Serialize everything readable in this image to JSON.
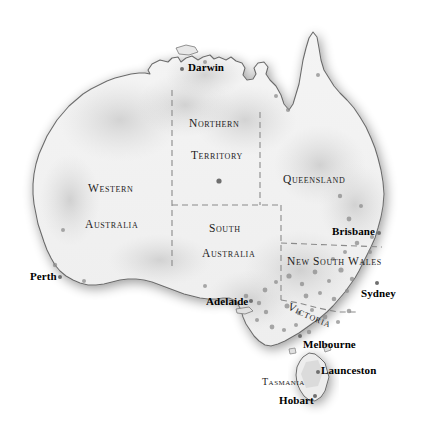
{
  "map": {
    "title": "Australia",
    "background_color": "#ffffff",
    "land_fill_color": "#f1f1f1",
    "coast_stroke_color": "#6b6b6b",
    "border_stroke_color": "#8a8a8a",
    "marker_color": "#6f6f6f",
    "label_color": "#111111"
  },
  "states": [
    {
      "id": "wa",
      "line1": "Western",
      "line2": "Australia",
      "x": 88,
      "y": 188,
      "x2": 88,
      "y2": 224
    },
    {
      "id": "nt",
      "line1": "Northern",
      "line2": "Territory",
      "x": 190,
      "y": 123,
      "x2": 192,
      "y2": 155
    },
    {
      "id": "sa",
      "line1": "South",
      "line2": "Australia",
      "x": 210,
      "y": 228,
      "x2": 203,
      "y2": 253
    },
    {
      "id": "qld",
      "line1": "Queensland",
      "x": 283,
      "y": 179
    },
    {
      "id": "nsw",
      "line1": "New South Wales",
      "x": 288,
      "y": 261
    },
    {
      "id": "vic",
      "line1": "Victoria",
      "x": 292,
      "y": 318
    },
    {
      "id": "tas",
      "line1": "Tasmania",
      "x": 268,
      "y": 382
    }
  ],
  "cities": [
    {
      "id": "darwin",
      "label": "Darwin",
      "label_x": 189,
      "label_y": 68,
      "dot_x": 182,
      "dot_y": 69
    },
    {
      "id": "brisbane",
      "label": "Brisbane",
      "label_x": 333,
      "label_y": 228,
      "dot_x": 379,
      "dot_y": 233
    },
    {
      "id": "perth",
      "label": "Perth",
      "label_x": 31,
      "label_y": 273,
      "dot_x": 60,
      "dot_y": 277
    },
    {
      "id": "sydney",
      "label": "Sydney",
      "label_x": 362,
      "label_y": 290,
      "dot_x": 377,
      "dot_y": 283
    },
    {
      "id": "adelaide",
      "label": "Adelaide",
      "label_x": 207,
      "label_y": 298,
      "dot_x": 251,
      "dot_y": 301
    },
    {
      "id": "melbourne",
      "label": "Melbourne",
      "label_x": 304,
      "label_y": 341,
      "dot_x": 300,
      "dot_y": 336
    },
    {
      "id": "launceston",
      "label": "Launceston",
      "label_x": 322,
      "label_y": 368,
      "dot_x": 318,
      "dot_y": 372
    },
    {
      "id": "hobart",
      "label": "Hobart",
      "label_x": 280,
      "label_y": 398,
      "dot_x": 315,
      "dot_y": 396
    }
  ],
  "interior_markers": [
    {
      "id": "alice-springs",
      "x": 219,
      "y": 181,
      "r": 2.6
    }
  ],
  "legend": {
    "state_border_style": "dashed",
    "state_border_note": "State and territory boundaries shown as dashed lines"
  }
}
